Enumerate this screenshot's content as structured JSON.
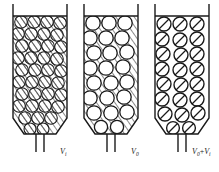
{
  "figure": {
    "background_color": "#ffffff",
    "line_color": "#1a1a1a",
    "hatch_color": "#2b2b2b",
    "width": 219,
    "height": 172
  },
  "columns": [
    {
      "id": "column-1",
      "name": "packed-column-interstitial",
      "label_main": "V",
      "label_sub": "i",
      "label_operator": "",
      "label_main2": "",
      "label_sub2": "",
      "label_full": "Vi",
      "bead_fill": "hatched",
      "medium_fill": "hatched",
      "bead_count": 30,
      "description": "Column with hatching inside beads and in interstitial space"
    },
    {
      "id": "column-2",
      "name": "packed-column-void",
      "label_main": "V",
      "label_sub": "0",
      "label_operator": "",
      "label_main2": "",
      "label_sub2": "",
      "label_full": "V0",
      "bead_fill": "white",
      "medium_fill": "hatched",
      "bead_count": 26,
      "description": "Column with white beads and hatched interstitial space"
    },
    {
      "id": "column-3",
      "name": "packed-column-total",
      "label_main": "V",
      "label_sub": "0",
      "label_operator": "+",
      "label_main2": "V",
      "label_sub2": "i",
      "label_full": "V0+Vi",
      "bead_fill": "slashed",
      "medium_fill": "white",
      "bead_count": 26,
      "description": "Column with slashed beads and white interstitial space"
    }
  ]
}
